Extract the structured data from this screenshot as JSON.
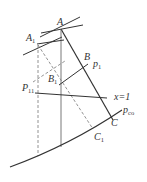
{
  "diagram": {
    "labels": {
      "A": "A",
      "A1": "A",
      "A1_sub": "1",
      "B": "B",
      "B1": "B",
      "B1_sub": "1",
      "P1": "p",
      "P1_sub": "1",
      "P11": "P",
      "P11_sub": "11",
      "x1": "x=1",
      "C": "C",
      "C1": "C",
      "C1_sub": "1",
      "pco": "p",
      "pco_sub": "co"
    },
    "colors": {
      "line": "#333333",
      "dashed": "#777777",
      "background": "#ffffff"
    }
  }
}
